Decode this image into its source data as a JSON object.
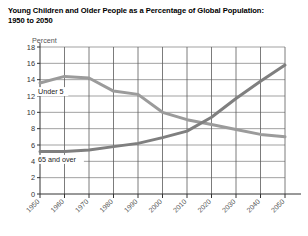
{
  "title": "Young Children and Older People as a Percentage of Global Population: 1950 to 2050",
  "title_line1": "Young Children and Older People as a Percentage of Global Population:",
  "title_line2": "1950 to 2050",
  "ylabel": "Percent",
  "chart_data": {
    "type": "line",
    "title": "Young Children and Older People as a Percentage of Global Population: 1950 to 2050",
    "xlabel": "",
    "ylabel": "Percent",
    "ylim": [
      0,
      18
    ],
    "xlim": [
      1950,
      2050
    ],
    "ytick_step": 2,
    "yticks": [
      0,
      2,
      4,
      6,
      8,
      10,
      12,
      14,
      16,
      18
    ],
    "xticks": [
      1950,
      1960,
      1970,
      1980,
      1990,
      2000,
      2010,
      2020,
      2030,
      2040,
      2050
    ],
    "xticklabels": [
      "1950",
      "1960",
      "1970",
      "1980",
      "1990",
      "2000",
      "2010",
      "2020",
      "2030",
      "2040",
      "2050"
    ],
    "grid": true,
    "grid_axis": "both",
    "legend": "inline-annotation",
    "x": [
      1950,
      1960,
      1970,
      1980,
      1990,
      2000,
      2010,
      2020,
      2030,
      2040,
      2050
    ],
    "series": [
      {
        "name": "Under 5",
        "label": "Under 5",
        "color": "#9b9b9b",
        "values": [
          13.6,
          14.4,
          14.2,
          12.6,
          12.2,
          10.0,
          9.1,
          8.5,
          7.9,
          7.3,
          7.0
        ]
      },
      {
        "name": "65 and over",
        "label": "65 and over",
        "color": "#7f7f7f",
        "values": [
          5.2,
          5.2,
          5.4,
          5.8,
          6.2,
          6.9,
          7.7,
          9.4,
          11.7,
          13.8,
          15.8
        ]
      }
    ],
    "annotations": [
      {
        "text": "Under 5",
        "x": 1950,
        "y": 12.6
      },
      {
        "text": "65 and over",
        "x": 1950,
        "y": 4.3
      }
    ]
  }
}
